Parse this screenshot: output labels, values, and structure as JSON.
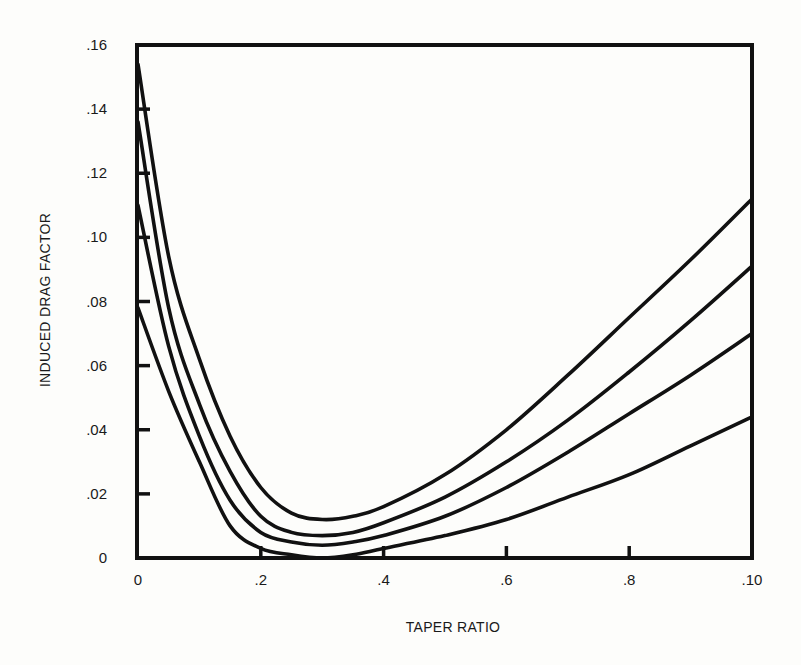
{
  "chart_data": {
    "type": "line",
    "title": "",
    "xlabel": "TAPER RATIO",
    "ylabel": "INDUCED DRAG FACTOR",
    "xlim": [
      0,
      1.0
    ],
    "ylim": [
      0,
      0.16
    ],
    "grid": false,
    "legend": null,
    "x_ticks": [
      {
        "value": 0,
        "label": "0"
      },
      {
        "value": 0.2,
        "label": ".2"
      },
      {
        "value": 0.4,
        "label": ".4"
      },
      {
        "value": 0.6,
        "label": ".6"
      },
      {
        "value": 0.8,
        "label": ".8"
      },
      {
        "value": 1.0,
        "label": ".10"
      }
    ],
    "y_ticks": [
      {
        "value": 0,
        "label": "0"
      },
      {
        "value": 0.02,
        "label": ".02"
      },
      {
        "value": 0.04,
        "label": ".04"
      },
      {
        "value": 0.06,
        "label": ".06"
      },
      {
        "value": 0.08,
        "label": ".08"
      },
      {
        "value": 0.1,
        "label": ".10"
      },
      {
        "value": 0.12,
        "label": ".12"
      },
      {
        "value": 0.14,
        "label": ".14"
      },
      {
        "value": 0.16,
        "label": ".16"
      }
    ],
    "x": [
      0,
      0.05,
      0.1,
      0.15,
      0.2,
      0.25,
      0.3,
      0.35,
      0.4,
      0.5,
      0.6,
      0.7,
      0.8,
      0.9,
      1.0
    ],
    "series": [
      {
        "name": "curve-1",
        "values": [
          0.154,
          0.094,
          0.062,
          0.038,
          0.022,
          0.014,
          0.012,
          0.013,
          0.016,
          0.026,
          0.04,
          0.057,
          0.075,
          0.093,
          0.112
        ]
      },
      {
        "name": "curve-2",
        "values": [
          0.136,
          0.078,
          0.048,
          0.027,
          0.013,
          0.008,
          0.007,
          0.008,
          0.011,
          0.019,
          0.03,
          0.043,
          0.058,
          0.074,
          0.091
        ]
      },
      {
        "name": "curve-3",
        "values": [
          0.11,
          0.066,
          0.038,
          0.018,
          0.008,
          0.005,
          0.004,
          0.005,
          0.007,
          0.013,
          0.022,
          0.033,
          0.045,
          0.057,
          0.07
        ]
      },
      {
        "name": "curve-4",
        "values": [
          0.078,
          0.052,
          0.03,
          0.01,
          0.003,
          0.001,
          0.0,
          0.001,
          0.003,
          0.007,
          0.012,
          0.019,
          0.026,
          0.035,
          0.044
        ]
      }
    ]
  }
}
